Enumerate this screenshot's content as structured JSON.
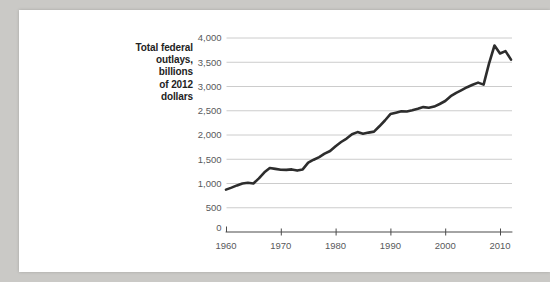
{
  "figure": {
    "y_axis_title_lines": [
      "Total federal",
      "outlays,",
      "billions",
      "of 2012",
      "dollars"
    ],
    "y_axis_title_full": "Total federal outlays, billions of 2012 dollars"
  },
  "colors": {
    "page_bg": "#cac9c6",
    "panel_bg": "#ffffff",
    "line": "#2d2d2d",
    "grid": "#cccccc",
    "axis": "#4b4b4b",
    "tick_label": "#58595b",
    "title_text": "#232323"
  },
  "chart_data": {
    "type": "line",
    "title": "Total federal outlays, billions of 2012 dollars",
    "xlabel": "",
    "ylabel": "Total federal outlays, billions of 2012 dollars",
    "grid": "horizontal",
    "legend": "none",
    "xlim": [
      1960,
      2012.3
    ],
    "ylim": [
      0,
      4000
    ],
    "x_ticks": [
      1960,
      1970,
      1980,
      1990,
      2000,
      2010
    ],
    "x_tick_labels": [
      "1960",
      "1970",
      "1980",
      "1990",
      "2000",
      "2010"
    ],
    "y_ticks": [
      0,
      500,
      1000,
      1500,
      2000,
      2500,
      3000,
      3500,
      4000
    ],
    "y_tick_labels": [
      "0",
      "500",
      "1,000",
      "1,500",
      "2,000",
      "2,500",
      "3,000",
      "3,500",
      "4,000"
    ],
    "x": [
      1960,
      1961,
      1962,
      1963,
      1964,
      1965,
      1966,
      1967,
      1968,
      1969,
      1970,
      1971,
      1972,
      1973,
      1974,
      1975,
      1976,
      1977,
      1978,
      1979,
      1980,
      1981,
      1982,
      1983,
      1984,
      1985,
      1986,
      1987,
      1988,
      1989,
      1990,
      1991,
      1992,
      1993,
      1994,
      1995,
      1996,
      1997,
      1998,
      1999,
      2000,
      2001,
      2002,
      2003,
      2004,
      2005,
      2006,
      2007,
      2008,
      2009,
      2010,
      2011,
      2012
    ],
    "series": [
      {
        "name": "Total federal outlays (billions of 2012 dollars)",
        "values": [
          875,
          915,
          960,
          1000,
          1015,
          1000,
          1105,
          1230,
          1320,
          1300,
          1285,
          1280,
          1290,
          1265,
          1290,
          1430,
          1490,
          1545,
          1615,
          1670,
          1770,
          1855,
          1925,
          2015,
          2060,
          2025,
          2050,
          2070,
          2180,
          2300,
          2430,
          2460,
          2490,
          2485,
          2510,
          2540,
          2575,
          2560,
          2585,
          2640,
          2700,
          2800,
          2870,
          2925,
          2985,
          3035,
          3080,
          3040,
          3470,
          3845,
          3680,
          3730,
          3555
        ]
      }
    ]
  }
}
